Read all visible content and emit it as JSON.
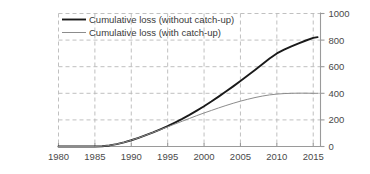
{
  "chart_data": {
    "type": "line",
    "title": "",
    "subtitle": "",
    "xlabel": "",
    "ylabel": "",
    "xlim": [
      1980,
      2016
    ],
    "ylim": [
      0,
      1000
    ],
    "grid": true,
    "y_axis_position": "right",
    "legend_position": "top-left",
    "xticks": [
      1980,
      1985,
      1990,
      1995,
      2000,
      2005,
      2010,
      2015
    ],
    "xtick_labels": [
      "1980",
      "1985",
      "1990",
      "1995",
      "2000",
      "2005",
      "2010",
      "2015"
    ],
    "yticks": [
      0,
      200,
      400,
      600,
      800,
      1000
    ],
    "ytick_labels": [
      "0",
      "200",
      "400",
      "600",
      "800",
      "1000"
    ],
    "series": [
      {
        "name": "Cumulative loss (without catch-up)",
        "color": "#1a1a1a",
        "width": 1.9,
        "x": [
          1980,
          1985,
          1986,
          1987,
          1988,
          1989,
          1990,
          1991,
          1992,
          1993,
          1994,
          1995,
          1996,
          1997,
          1998,
          1999,
          2000,
          2001,
          2002,
          2003,
          2004,
          2005,
          2006,
          2007,
          2008,
          2009,
          2010,
          2011,
          2012,
          2013,
          2014,
          2015,
          2015.6
        ],
        "values": [
          0,
          0,
          2,
          8,
          18,
          31,
          47,
          65,
          85,
          106,
          129,
          153,
          180,
          208,
          238,
          270,
          303,
          338,
          375,
          413,
          452,
          492,
          533,
          575,
          618,
          661,
          700,
          728,
          752,
          775,
          797,
          817,
          822
        ]
      },
      {
        "name": "Cumulative loss (with catch-up)",
        "color": "#8c8c8c",
        "width": 1.0,
        "x": [
          1980,
          1985,
          1986,
          1987,
          1988,
          1989,
          1990,
          1991,
          1992,
          1993,
          1994,
          1995,
          1996,
          1997,
          1998,
          1999,
          2000,
          2001,
          2002,
          2003,
          2004,
          2005,
          2006,
          2007,
          2008,
          2009,
          2010,
          2011,
          2012,
          2013,
          2014,
          2015,
          2015.6
        ],
        "values": [
          0,
          0,
          2,
          8,
          18,
          31,
          47,
          65,
          85,
          106,
          127,
          148,
          169,
          190,
          211,
          232,
          252,
          271,
          290,
          308,
          325,
          341,
          355,
          368,
          379,
          388,
          394,
          398,
          400,
          401,
          401,
          400,
          400
        ]
      }
    ],
    "legend_entries": [
      {
        "label": "Cumulative loss (without catch-up)",
        "color": "#1a1a1a",
        "width": 1.9
      },
      {
        "label": "Cumulative loss (with catch-up)",
        "color": "#8c8c8c",
        "width": 1.0
      }
    ],
    "colors": {
      "grid": "#b9b9b9",
      "axis": "#9a9a9a",
      "text": "#4a4a4a",
      "background": "#ffffff"
    }
  }
}
